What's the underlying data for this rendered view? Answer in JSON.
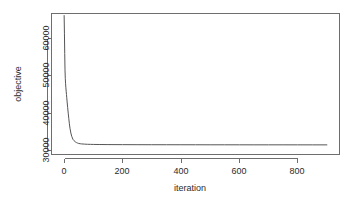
{
  "chart_data": {
    "type": "line",
    "title": "",
    "subtitle": "",
    "xlabel": "iteration",
    "ylabel": "objective",
    "xlim": [
      -45,
      945
    ],
    "ylim": [
      28800,
      67500
    ],
    "xticks": [
      0,
      200,
      400,
      600,
      800
    ],
    "xtick_labels": [
      "0",
      "200",
      "400",
      "600",
      "800"
    ],
    "yticks": [
      30000,
      40000,
      50000,
      60000
    ],
    "ytick_labels": [
      "30000",
      "40000",
      "50000",
      "60000"
    ],
    "grid": false,
    "legend": null,
    "legend_position": "none",
    "line_color": "#555555",
    "series": [
      {
        "name": "objective",
        "x": [
          0,
          1,
          2,
          3,
          4,
          5,
          6,
          7,
          8,
          9,
          10,
          12,
          14,
          16,
          18,
          20,
          23,
          26,
          30,
          34,
          38,
          42,
          46,
          50,
          55,
          60,
          70,
          80,
          90,
          100,
          120,
          150,
          200,
          250,
          300,
          350,
          400,
          450,
          500,
          550,
          600,
          650,
          700,
          750,
          800,
          850,
          900
        ],
        "y": [
          66800,
          62000,
          56500,
          52000,
          49600,
          48200,
          47100,
          46200,
          45300,
          44400,
          43500,
          41800,
          40200,
          38700,
          37300,
          36100,
          34800,
          33900,
          33100,
          32700,
          32400,
          32200,
          32050,
          31950,
          31870,
          31820,
          31760,
          31720,
          31700,
          31680,
          31660,
          31640,
          31620,
          31610,
          31600,
          31595,
          31590,
          31585,
          31580,
          31578,
          31575,
          31572,
          31570,
          31568,
          31565,
          31562,
          31560
        ]
      }
    ]
  },
  "axes": {
    "y_axis_title": "objective",
    "x_axis_title": "iteration"
  }
}
